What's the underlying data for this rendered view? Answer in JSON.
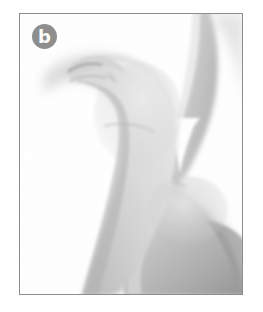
{
  "figure": {
    "panel_label": "b",
    "caption": ""
  },
  "badge": {
    "letter": "b",
    "shape": "circle",
    "fill_color": "#8e8e8e",
    "text_color": "#fdfdfd"
  },
  "frame": {
    "border_color": "#8d8d8d",
    "border_width_px": 1.5,
    "background_color": "#ffffff",
    "x": 19,
    "y": 13,
    "width": 224,
    "height": 282
  },
  "canvas": {
    "width": 263,
    "height": 312,
    "background_color": "#ffffff"
  },
  "photo": {
    "mode": "grayscale",
    "subject": "hand",
    "icon_names": [
      "thumb-shape",
      "index-finger-shape",
      "web-space-notch",
      "thumbnail-shape",
      "drop-shadow"
    ],
    "tones": {
      "highlight": "#efefef",
      "light_skin": "#dedede",
      "mid_skin": "#c6c6c6",
      "shade_skin": "#ababab",
      "deep_shade": "#949494",
      "shadow": "#d6d6d6",
      "nail_edge": "#8f8f8f"
    }
  }
}
